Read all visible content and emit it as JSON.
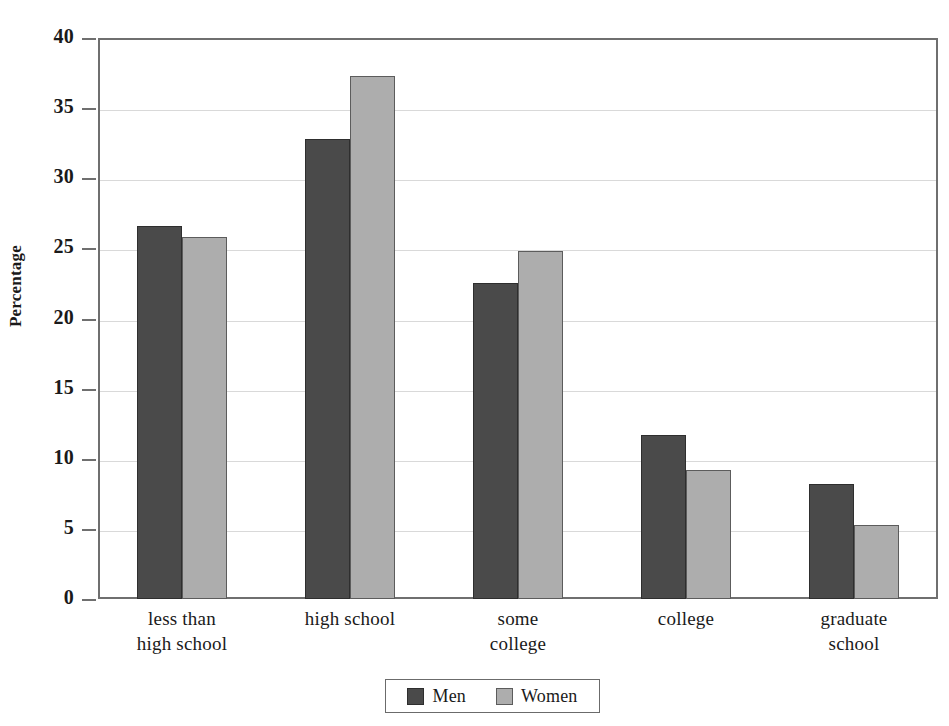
{
  "chart_data": {
    "type": "bar",
    "title": "",
    "subtitle": "",
    "xlabel": "",
    "ylabel": "Percentage",
    "ylim": [
      0,
      40
    ],
    "ytick_step": 5,
    "yticks": [
      0,
      5,
      10,
      15,
      20,
      25,
      30,
      35,
      40
    ],
    "ytick_labels": [
      "0",
      "5",
      "10",
      "15",
      "20",
      "25",
      "30",
      "35",
      "40"
    ],
    "grid": true,
    "grid_axis": "y",
    "legend_position": "bottom-center",
    "categories": [
      "less than high school",
      "high school",
      "some college",
      "college",
      "graduate school"
    ],
    "category_label_lines": [
      [
        "less than",
        "high school"
      ],
      [
        "high school"
      ],
      [
        "some",
        "college"
      ],
      [
        "college"
      ],
      [
        "graduate",
        "school"
      ]
    ],
    "series": [
      {
        "name": "Men",
        "color": "#4a4a4a",
        "values": [
          26.6,
          32.8,
          22.5,
          11.7,
          8.2
        ]
      },
      {
        "name": "Women",
        "color": "#adadad",
        "values": [
          25.8,
          37.3,
          24.8,
          9.2,
          5.3
        ]
      }
    ],
    "annotations": []
  },
  "legend": {
    "items": [
      {
        "label": "Men",
        "color": "#4a4a4a"
      },
      {
        "label": "Women",
        "color": "#adadad"
      }
    ]
  },
  "colors": {
    "men": "#4a4a4a",
    "women": "#adadad",
    "axis": "#6f6f6f",
    "gridline": "#d9d9d9",
    "background": "#ffffff",
    "text": "#1a1a1a"
  }
}
